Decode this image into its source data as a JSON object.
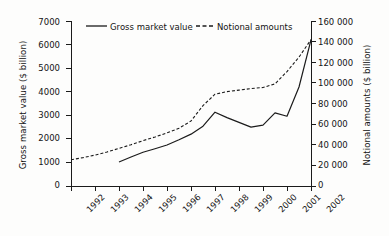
{
  "chart_data": {
    "type": "line",
    "title": "",
    "xlabel": "",
    "ylabel": "Gross market value ($ billion)",
    "y2label": "Notional amounts ($ billion)",
    "x": [
      "1992",
      "1993",
      "1994",
      "1995",
      "1996",
      "1997",
      "1998",
      "1999",
      "2000",
      "2001",
      "2002"
    ],
    "xlim": [
      1992,
      2002
    ],
    "ylim": [
      0,
      7000
    ],
    "y2lim": [
      0,
      160000
    ],
    "yticks": [
      "0",
      "1000",
      "2000",
      "3000",
      "4000",
      "5000",
      "6000",
      "7000"
    ],
    "y2ticks": [
      "0",
      "20 000",
      "40 000",
      "60 000",
      "80 000",
      "100 000",
      "120 000",
      "140 000",
      "160 000"
    ],
    "grid": false,
    "legend_position": "top-center",
    "series": [
      {
        "name": "Gross market value",
        "axis": "left",
        "style": "solid",
        "color": "#1b1b1b",
        "x": [
          1994.0,
          1994.5,
          1995.0,
          1995.5,
          1996.0,
          1996.5,
          1997.0,
          1997.5,
          1998.0,
          1998.5,
          1999.0,
          1999.5,
          2000.0,
          2000.5,
          2001.0,
          2001.5,
          2002.0
        ],
        "values": [
          1020,
          1230,
          1430,
          1580,
          1740,
          1960,
          2200,
          2540,
          3130,
          2900,
          2700,
          2500,
          2580,
          3100,
          2960,
          4200,
          6200
        ]
      },
      {
        "name": "Notional amounts",
        "axis": "right",
        "style": "dashed",
        "color": "#1b1b1b",
        "x": [
          1992.0,
          1992.5,
          1993.0,
          1993.5,
          1994.0,
          1994.5,
          1995.0,
          1995.5,
          1996.0,
          1996.5,
          1997.0,
          1997.5,
          1998.0,
          1998.5,
          1999.0,
          1999.5,
          2000.0,
          2000.5,
          2001.0,
          2001.5,
          2002.0
        ],
        "values": [
          25500,
          27500,
          30000,
          33000,
          36500,
          40000,
          44000,
          47500,
          51500,
          56000,
          63000,
          78000,
          89000,
          91500,
          93000,
          94500,
          95500,
          99000,
          111000,
          125000,
          142000
        ]
      }
    ]
  },
  "legend": {
    "items": [
      {
        "label": "Gross market value",
        "style": "solid"
      },
      {
        "label": "Notional amounts",
        "style": "dashed"
      }
    ]
  },
  "axes": {
    "left": {
      "title": "Gross market value ($ billion)",
      "ticks": [
        "7000",
        "6000",
        "5000",
        "4000",
        "3000",
        "2000",
        "1000",
        "0"
      ]
    },
    "right": {
      "title": "Notional amounts ($ billion)",
      "ticks": [
        "160 000",
        "140 000",
        "120 000",
        "100 000",
        "80 000",
        "60 000",
        "40 000",
        "20 000",
        "0"
      ]
    },
    "bottom": {
      "ticks": [
        "1992",
        "1993",
        "1994",
        "1995",
        "1996",
        "1997",
        "1998",
        "1999",
        "2000",
        "2001",
        "2002"
      ]
    }
  }
}
